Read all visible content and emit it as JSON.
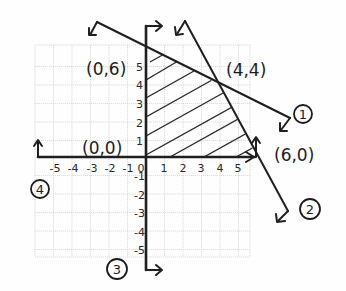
{
  "diagram": {
    "type": "linear-programming-feasible-region",
    "x_axis": {
      "tick_labels": [
        "-5",
        "-4",
        "-3",
        "-2",
        "-1",
        "0",
        "1",
        "2",
        "3",
        "4",
        "5"
      ]
    },
    "y_axis": {
      "tick_labels_positive": [
        "1",
        "2",
        "3",
        "4",
        "5"
      ],
      "tick_labels_negative": [
        "-1",
        "-2",
        "-3",
        "-4",
        "-5"
      ]
    },
    "vertices": [
      {
        "label": "(0,6)"
      },
      {
        "label": "(4,4)"
      },
      {
        "label": "(0,0)"
      },
      {
        "label": "(6,0)"
      }
    ],
    "constraint_labels": [
      "1",
      "2",
      "3",
      "4"
    ],
    "shaded_region": "hatched feasible region bounded by (0,0), (0,6), (4,4), (6,0)"
  }
}
